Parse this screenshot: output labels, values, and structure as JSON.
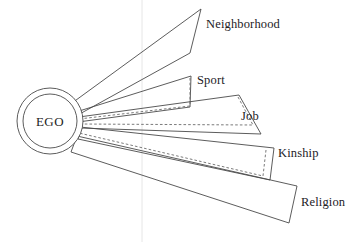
{
  "figure": {
    "type": "radial-wedge-diagram",
    "title": "",
    "background_color": "#ffffff",
    "stroke_color": "#4a4a4a",
    "dashed_stroke_color": "#6b6b6b",
    "guide_line_color": "#e3e3e3",
    "text_color": "#23211f"
  },
  "center_node": {
    "label": "EGO",
    "shape": "double-circle",
    "cx": 50,
    "cy": 121,
    "outer_radius": 33,
    "inner_radius": 27
  },
  "guide": {
    "name": "vertical-guide-line",
    "x": 142,
    "y1": 0,
    "y2": 242
  },
  "sectors": [
    {
      "id": "neighborhood",
      "label": "Neighborhood",
      "label_x": 206,
      "label_y": 18,
      "wedge_points": "72,103 201,9 190,53 76,116",
      "dashed_points": "",
      "has_dashed_fill": false,
      "angle_deg": -36,
      "fill_fraction": 1.0
    },
    {
      "id": "sport",
      "label": "Sport",
      "label_x": 197,
      "label_y": 75,
      "wedge_points": "76,112 191,76 190,107 78,122",
      "dashed_points": "79,118 189,103",
      "has_dashed_fill": true,
      "angle_deg": -18,
      "fill_fraction": 0.95
    },
    {
      "id": "job",
      "label": "Job",
      "label_x": 241,
      "label_y": 110,
      "wedge_points": "79,117 239,95 261,134 80,128",
      "dashed_points": "80,124 254,126",
      "has_dashed_fill": true,
      "angle_deg": -6,
      "fill_fraction": 0.92
    },
    {
      "id": "kinship",
      "label": "Kinship",
      "label_x": 279,
      "label_y": 148,
      "wedge_points": "80,127 274,148 270,180 78,139",
      "dashed_points": "80,133 268,165",
      "has_dashed_fill": true,
      "angle_deg": 7,
      "fill_fraction": 0.9
    },
    {
      "id": "religion",
      "label": "Religion",
      "label_x": 302,
      "label_y": 202,
      "wedge_points": "77,136 297,186 289,223 71,152",
      "dashed_points": "",
      "has_dashed_fill": false,
      "angle_deg": 17,
      "fill_fraction": 1.0
    }
  ]
}
